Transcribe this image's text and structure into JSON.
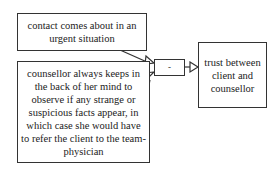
{
  "diagram": {
    "type": "argument-map",
    "nodes": [
      {
        "id": "premise1",
        "text": "contact comes about in an urgent situation"
      },
      {
        "id": "premise2",
        "text": "counsellor always keeps in the back of her mind to observe if any strange or suspicious facts appear, in which case she would have to refer the client to the team-physician"
      },
      {
        "id": "operator",
        "text": "-"
      },
      {
        "id": "conclusion",
        "text": "trust between client and counsellor"
      }
    ],
    "edges": [
      {
        "from": "premise1",
        "to": "operator"
      },
      {
        "from": "premise2",
        "to": "operator"
      },
      {
        "from": "operator",
        "to": "conclusion"
      }
    ]
  },
  "colors": {
    "stroke": "#333333",
    "background": "#ffffff",
    "text": "#222222"
  }
}
